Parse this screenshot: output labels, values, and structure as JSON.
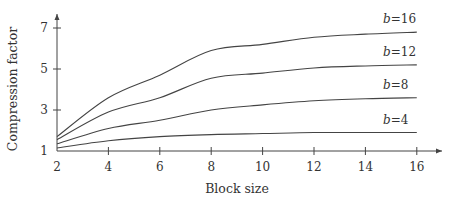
{
  "chart_data": {
    "type": "line",
    "title": "",
    "xlabel": "Block size",
    "ylabel": "Compression factor",
    "x": [
      2,
      4,
      6,
      8,
      10,
      12,
      14,
      16
    ],
    "xticks": [
      2,
      4,
      6,
      8,
      10,
      12,
      14,
      16
    ],
    "yticks": [
      1,
      3,
      5,
      7
    ],
    "xlim": [
      2,
      17
    ],
    "ylim": [
      1,
      7.7
    ],
    "grid": false,
    "legend_position": "inline-right",
    "series": [
      {
        "name": "b=16",
        "label_var": "b",
        "label_val": "16",
        "values": [
          1.7,
          3.6,
          4.7,
          5.9,
          6.2,
          6.55,
          6.7,
          6.8
        ]
      },
      {
        "name": "b=12",
        "label_var": "b",
        "label_val": "12",
        "values": [
          1.55,
          2.9,
          3.6,
          4.55,
          4.8,
          5.05,
          5.15,
          5.2
        ]
      },
      {
        "name": "b=8",
        "label_var": "b",
        "label_val": "8",
        "values": [
          1.35,
          2.1,
          2.5,
          3.0,
          3.25,
          3.45,
          3.55,
          3.6
        ]
      },
      {
        "name": "b=4",
        "label_var": "b",
        "label_val": "4",
        "values": [
          1.15,
          1.5,
          1.7,
          1.8,
          1.85,
          1.9,
          1.9,
          1.9
        ]
      }
    ]
  },
  "layout": {
    "x_px": {
      "min_val": 2,
      "min_px": 57,
      "per_unit": 25.7
    },
    "y_px": {
      "min_val": 1,
      "min_px": 151,
      "per_unit": 20.5
    }
  }
}
